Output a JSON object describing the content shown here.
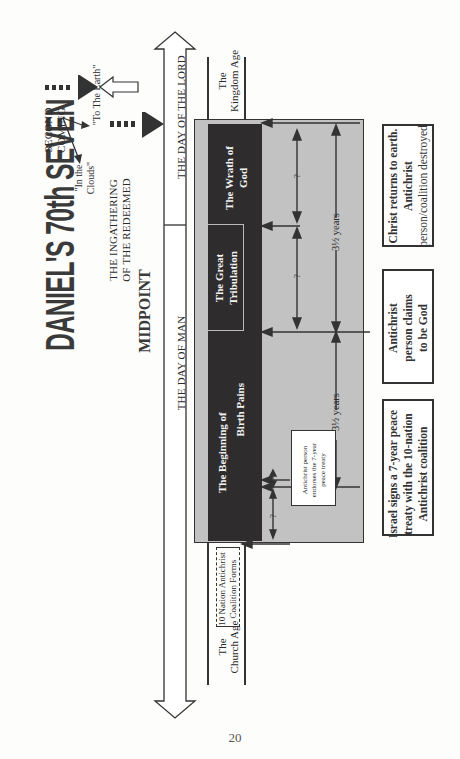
{
  "page": {
    "title": "DANIEL'S 70th SEVEN",
    "page_number": "20",
    "orientation": "rotated-90-ccw"
  },
  "events_top": {
    "ingathering": "THE INGATHERING\nOF THE REDEEMED",
    "ingathering_line1": "THE INGATHERING",
    "ingathering_line2": "OF THE REDEEMED",
    "second_coming_line1": "SECOND",
    "second_coming_line2": "COMING",
    "in_the_clouds_line1": "\"In the",
    "in_the_clouds_line2": "Clouds\"",
    "to_the_earth": "\"To The Earth\"",
    "midpoint": "MIDPOINT"
  },
  "timeline": {
    "day_of_man": "THE DAY OF MAN",
    "day_of_lord": "THE DAY OF THE LORD"
  },
  "ages": {
    "church_line1": "The",
    "church_line2": "Church Age",
    "kingdom_line1": "The",
    "kingdom_line2": "Kingdom Age",
    "coalition_line1": "10 Nation Antichrist",
    "coalition_line2": "Coalition Forms"
  },
  "periods": {
    "birth_pains_line1": "The Beginning of",
    "birth_pains_line2": "Birth Pains",
    "great_trib_line1": "The Great",
    "great_trib_line2": "Tribulation",
    "wrath_line1": "The Wrath of",
    "wrath_line2": "God"
  },
  "durations": {
    "first_half": "3½ years",
    "second_half": "3½ years",
    "unknown": "?"
  },
  "notes": {
    "endorses_line1": "Antichrist person",
    "endorses_line2": "endorses the 7-year",
    "endorses_line3": "peace treaty",
    "israel_line1": "Israel signs a 7-year peace",
    "israel_line2": "treaty with the 10-nation",
    "israel_line3": "Antichrist coalition",
    "claims_line1": "Antichrist",
    "claims_line2": "person claims",
    "claims_line3": "to be God",
    "christ_line1": "Christ returns to earth.",
    "christ_line2": "Antichrist",
    "christ_line3": "person/coalition destroyed"
  },
  "colors": {
    "dark_band": "#2e2c2d",
    "gray_panel": "#c2c2c2",
    "ink": "#333333",
    "paper": "#fdfdfc"
  }
}
